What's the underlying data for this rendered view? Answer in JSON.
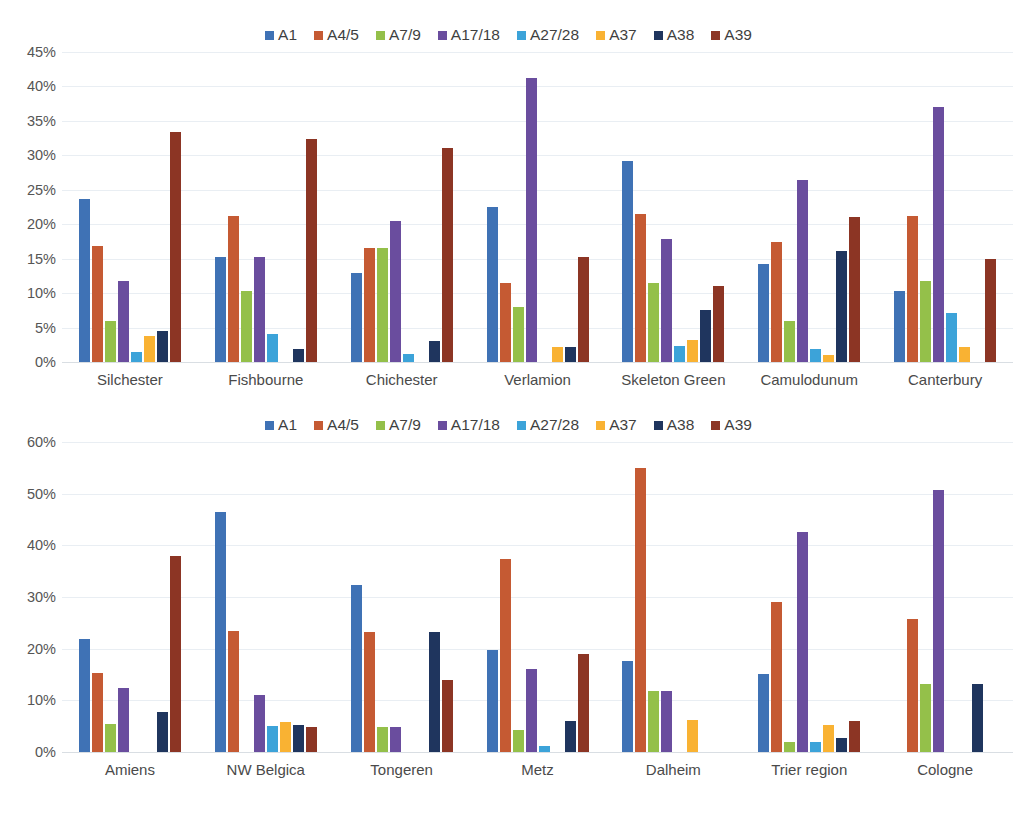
{
  "series_colors": {
    "A1": "#3f72b5",
    "A4/5": "#c55a33",
    "A7/9": "#94c04a",
    "A17/18": "#6a4d9e",
    "A27/28": "#3ca3d9",
    "A37": "#f9b233",
    "A38": "#1f355e",
    "A39": "#8c3524"
  },
  "legend": [
    {
      "label": "A1"
    },
    {
      "label": "A4/5"
    },
    {
      "label": "A7/9"
    },
    {
      "label": "A17/18"
    },
    {
      "label": "A27/28"
    },
    {
      "label": "A37"
    },
    {
      "label": "A38"
    },
    {
      "label": "A39"
    }
  ],
  "chart_data": [
    {
      "type": "bar",
      "title": "",
      "xlabel": "",
      "ylabel": "",
      "ylim": [
        0,
        45
      ],
      "ytick_step": 5,
      "ytick_labels": [
        "0%",
        "5%",
        "10%",
        "15%",
        "20%",
        "25%",
        "30%",
        "35%",
        "40%",
        "45%"
      ],
      "grid": true,
      "legend_position": "top",
      "categories": [
        "Silchester",
        "Fishbourne",
        "Chichester",
        "Verlamion",
        "Skeleton Green",
        "Camulodunum",
        "Canterbury"
      ],
      "series": [
        {
          "name": "A1",
          "values": [
            23.7,
            15.2,
            12.9,
            22.5,
            29.2,
            14.3,
            10.3
          ]
        },
        {
          "name": "A4/5",
          "values": [
            16.8,
            21.2,
            16.6,
            11.5,
            21.5,
            17.4,
            21.2
          ]
        },
        {
          "name": "A7/9",
          "values": [
            6.0,
            10.3,
            16.6,
            8.0,
            11.5,
            6.0,
            11.8
          ]
        },
        {
          "name": "A17/18",
          "values": [
            11.7,
            15.2,
            20.4,
            41.2,
            17.8,
            26.4,
            37.0
          ]
        },
        {
          "name": "A27/28",
          "values": [
            1.4,
            4.0,
            1.1,
            0,
            2.3,
            1.9,
            7.1
          ]
        },
        {
          "name": "A37",
          "values": [
            3.8,
            0,
            0,
            2.2,
            3.2,
            1.0,
            2.2
          ]
        },
        {
          "name": "A38",
          "values": [
            4.5,
            1.9,
            3.0,
            2.2,
            7.6,
            16.1,
            0
          ]
        },
        {
          "name": "A39",
          "values": [
            33.4,
            32.4,
            31.1,
            15.3,
            11.0,
            21.1,
            15.0
          ]
        }
      ]
    },
    {
      "type": "bar",
      "title": "",
      "xlabel": "",
      "ylabel": "",
      "ylim": [
        0,
        60
      ],
      "ytick_step": 10,
      "ytick_labels": [
        "0%",
        "10%",
        "20%",
        "30%",
        "40%",
        "50%",
        "60%"
      ],
      "grid": true,
      "legend_position": "top",
      "categories": [
        "Amiens",
        "NW Belgica",
        "Tongeren",
        "Metz",
        "Dalheim",
        "Trier region",
        "Cologne"
      ],
      "series": [
        {
          "name": "A1",
          "values": [
            21.8,
            46.5,
            32.3,
            19.7,
            17.6,
            15.1,
            0
          ]
        },
        {
          "name": "A4/5",
          "values": [
            15.3,
            23.4,
            23.3,
            37.3,
            55.0,
            29.0,
            25.8
          ]
        },
        {
          "name": "A7/9",
          "values": [
            5.5,
            0,
            4.8,
            4.2,
            11.9,
            2.0,
            13.2
          ]
        },
        {
          "name": "A17/18",
          "values": [
            12.3,
            11.0,
            4.8,
            16.0,
            11.9,
            42.5,
            50.8
          ]
        },
        {
          "name": "A27/28",
          "values": [
            0,
            5.0,
            0,
            1.2,
            0,
            2.0,
            0
          ]
        },
        {
          "name": "A37",
          "values": [
            0,
            5.8,
            0,
            0,
            6.1,
            5.2,
            0
          ]
        },
        {
          "name": "A38",
          "values": [
            7.7,
            5.2,
            23.3,
            6.0,
            0,
            2.8,
            13.2
          ]
        },
        {
          "name": "A39",
          "values": [
            38.0,
            4.8,
            14.0,
            18.9,
            0,
            6.0,
            0
          ]
        }
      ]
    }
  ],
  "caption": ""
}
